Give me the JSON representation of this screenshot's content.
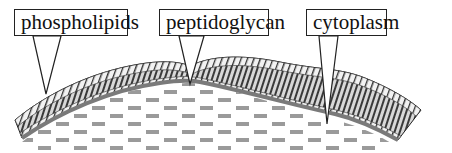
{
  "diagram": {
    "type": "cell wall cross-section",
    "labels": [
      {
        "id": "phospholipids",
        "text": "phospholipids"
      },
      {
        "id": "peptidoglycan",
        "text": "peptidoglycan"
      },
      {
        "id": "cytoplasm",
        "text": "cytoplasm"
      }
    ],
    "colors": {
      "outline": "#222222",
      "membrane_dark": "#3a3a3a",
      "membrane_mid": "#888888",
      "membrane_light": "#e6e6e6",
      "peptidoglycan_line": "#7a7a7a",
      "cytoplasm_dash": "#9a9a9a",
      "background": "#ffffff"
    }
  }
}
